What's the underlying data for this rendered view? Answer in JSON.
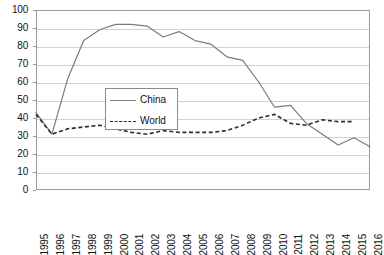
{
  "chart_data": {
    "type": "line",
    "title": "",
    "subtitle": "",
    "xlabel": "",
    "ylabel": "",
    "ylim": [
      0,
      100
    ],
    "ytick_step": 10,
    "yticks": [
      0,
      10,
      20,
      30,
      40,
      50,
      60,
      70,
      80,
      90,
      100
    ],
    "grid": true,
    "grid_axis": "y",
    "legend_position": "center-left-inside",
    "categories": [
      "1995",
      "1996",
      "1997",
      "1998",
      "1999",
      "2000",
      "2001",
      "2002",
      "2003",
      "2004",
      "2005",
      "2006",
      "2007",
      "2008",
      "2009",
      "2010",
      "2011",
      "2012",
      "2013",
      "2014",
      "2015",
      "2016"
    ],
    "x": [
      1995,
      1996,
      1997,
      1998,
      1999,
      2000,
      2001,
      2002,
      2003,
      2004,
      2005,
      2006,
      2007,
      2008,
      2009,
      2010,
      2011,
      2012,
      2013,
      2014,
      2015,
      2016
    ],
    "series": [
      {
        "name": "China",
        "style": "solid",
        "color": "#7b7b7b",
        "values": [
          43,
          31,
          62,
          83,
          89,
          92,
          92,
          91,
          85,
          88,
          83,
          81,
          74,
          72,
          60,
          46,
          47,
          37,
          31,
          25,
          29,
          24
        ]
      },
      {
        "name": "World",
        "style": "dashed",
        "color": "#2c2c2c",
        "values": [
          42,
          31,
          34,
          35,
          36,
          34,
          32,
          31,
          33,
          32,
          32,
          32,
          33,
          36,
          40,
          42,
          37,
          36,
          39,
          38,
          38,
          null
        ]
      }
    ]
  },
  "legend": {
    "entries": [
      {
        "label": "China",
        "swatch": "solid-line-swatch"
      },
      {
        "label": "World",
        "swatch": "dashed-line-swatch"
      }
    ]
  },
  "colors": {
    "china_line": "#7b7b7b",
    "world_line": "#2c2c2c",
    "gridline": "#d2d2d2",
    "frame": "#9a9a9a",
    "background": "#ffffff",
    "text": "#111111"
  }
}
